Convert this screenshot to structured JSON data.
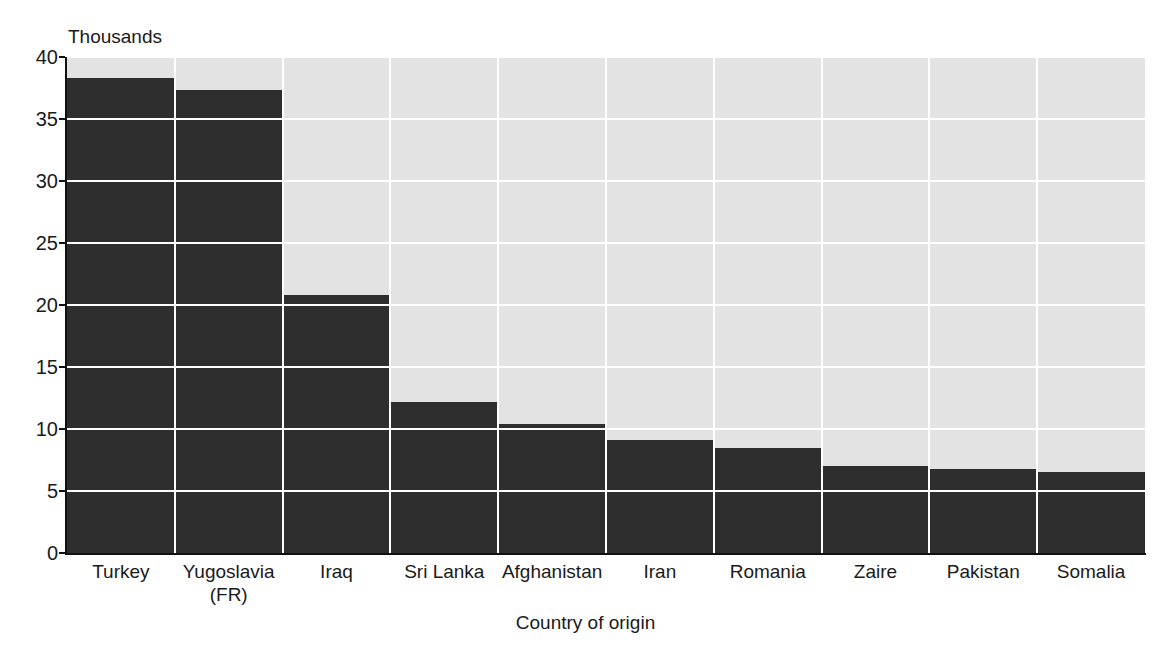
{
  "chart_data": {
    "type": "bar",
    "title": "",
    "subtitle": "",
    "unit_caption": "Thousands",
    "xlabel": "Country of origin",
    "ylabel": "",
    "ylim": [
      0,
      40
    ],
    "yticks": [
      0,
      5,
      10,
      15,
      20,
      25,
      30,
      35,
      40
    ],
    "ytick_labels": [
      "0",
      "5",
      "10",
      "15",
      "20",
      "25",
      "30",
      "35",
      "40"
    ],
    "grid": true,
    "legend": null,
    "categories": [
      "Turkey",
      "Yugoslavia (FR)",
      "Iraq",
      "Sri Lanka",
      "Afghanistan",
      "Iran",
      "Romania",
      "Zaire",
      "Pakistan",
      "Somalia"
    ],
    "category_label_lines": [
      [
        "Turkey"
      ],
      [
        "Yugoslavia",
        "(FR)"
      ],
      [
        "Iraq"
      ],
      [
        "Sri Lanka"
      ],
      [
        "Afghanistan"
      ],
      [
        "Iran"
      ],
      [
        "Romania"
      ],
      [
        "Zaire"
      ],
      [
        "Pakistan"
      ],
      [
        "Somalia"
      ]
    ],
    "values": [
      38.3,
      37.3,
      20.8,
      12.2,
      10.4,
      9.1,
      8.5,
      7.0,
      6.8,
      6.5
    ],
    "colors": {
      "bar": "#2e2e2e",
      "plot_background": "#e3e3e3",
      "gridline": "#ffffff",
      "axis": "#111111",
      "text": "#1a1a1a",
      "page_background": "#ffffff"
    }
  }
}
